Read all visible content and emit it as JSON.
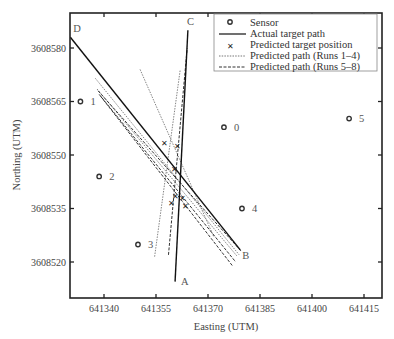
{
  "chart_data": {
    "type": "line",
    "title": "",
    "xlabel": "Easting (UTM)",
    "ylabel": "Northing (UTM)",
    "xlim": [
      641330,
      641420
    ],
    "ylim": [
      3608510,
      3608590
    ],
    "grid": false,
    "legend_position": "upper right",
    "x_ticks": [
      641340,
      641355,
      641370,
      641385,
      641400,
      641415
    ],
    "y_ticks": [
      3608520,
      3608535,
      3608550,
      3608565,
      3608580
    ],
    "legend": [
      {
        "key": "sensor",
        "label": "Sensor"
      },
      {
        "key": "actual",
        "label": "Actual target path"
      },
      {
        "key": "predicted_pos",
        "label": "Predicted target position"
      },
      {
        "key": "runs_1_4",
        "label": "Predicted path (Runs 1–4)"
      },
      {
        "key": "runs_5_8",
        "label": "Predicted path (Runs 5–8)"
      }
    ],
    "sensors": [
      {
        "id": "0",
        "x": 641374.6,
        "y": 3608557.8
      },
      {
        "id": "1",
        "x": 641333.2,
        "y": 3608565.0
      },
      {
        "id": "2",
        "x": 641338.6,
        "y": 3608544.0
      },
      {
        "id": "3",
        "x": 641349.8,
        "y": 3608524.9
      },
      {
        "id": "4",
        "x": 641379.8,
        "y": 3608535.0
      },
      {
        "id": "5",
        "x": 641410.7,
        "y": 3608560.2
      }
    ],
    "actual_paths": [
      {
        "name": "D-B",
        "start_label": "D",
        "end_label": "B",
        "x": [
          641330.3,
          641379.3
        ],
        "y": [
          3608583.0,
          3608523.4
        ]
      },
      {
        "name": "A-C",
        "start_label": "A",
        "end_label": "C",
        "x": [
          641360.5,
          641364.2
        ],
        "y": [
          3608514.5,
          3608585.0
        ]
      }
    ],
    "predicted_paths_runs_1_4": [
      {
        "x": [
          641337.5,
          641379.0
        ],
        "y": [
          3608571.5,
          3608522.0
        ]
      },
      {
        "x": [
          641338.0,
          641378.5
        ],
        "y": [
          3608568.5,
          3608521.5
        ]
      },
      {
        "x": [
          641350.4,
          641371.7
        ],
        "y": [
          3608574.0,
          3608527.0
        ]
      },
      {
        "x": [
          641354.6,
          641362.0
        ],
        "y": [
          3608521.5,
          3608574.0
        ]
      }
    ],
    "predicted_paths_runs_5_8": [
      {
        "x": [
          641338.3,
          641379.6
        ],
        "y": [
          3608568.0,
          3608523.0
        ]
      },
      {
        "x": [
          641338.6,
          641378.0
        ],
        "y": [
          3608567.0,
          3608520.0
        ]
      },
      {
        "x": [
          641339.0,
          641377.0
        ],
        "y": [
          3608566.5,
          3608519.0
        ]
      },
      {
        "x": [
          641358.6,
          641364.0
        ],
        "y": [
          3608522.0,
          3608580.0
        ]
      }
    ],
    "predicted_positions": [
      {
        "x": 641357.4,
        "y": 3608553.2
      },
      {
        "x": 641361.2,
        "y": 3608552.5
      },
      {
        "x": 641360.2,
        "y": 3608546.0
      },
      {
        "x": 641360.5,
        "y": 3608538.5
      },
      {
        "x": 641362.5,
        "y": 3608538.0
      },
      {
        "x": 641359.5,
        "y": 3608536.5
      },
      {
        "x": 641363.5,
        "y": 3608535.6
      }
    ]
  }
}
